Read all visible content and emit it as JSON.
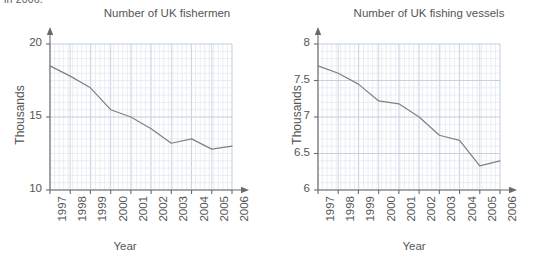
{
  "page": {
    "cut_top_text": "in 2006."
  },
  "charts": [
    {
      "id": "uk-fishermen",
      "title": "Number of UK fishermen",
      "ylabel": "Thousands",
      "xlabel": "Year"
    },
    {
      "id": "uk-fishing-vessels",
      "title": "Number of UK fishing vessels",
      "ylabel": "Thousands",
      "xlabel": "Year"
    }
  ],
  "chart_data": [
    {
      "type": "line",
      "title": "Number of UK fishermen",
      "xlabel": "Year",
      "ylabel": "Thousands",
      "categories": [
        "1997",
        "1998",
        "1999",
        "2000",
        "2001",
        "2002",
        "2003",
        "2004",
        "2005",
        "2006"
      ],
      "x": [
        1997,
        1998,
        1999,
        2000,
        2001,
        2002,
        2003,
        2004,
        2005,
        2006
      ],
      "values": [
        18.5,
        17.8,
        17.0,
        15.5,
        15.0,
        14.2,
        13.2,
        13.5,
        12.8,
        13.0
      ],
      "ylim": [
        10,
        20
      ],
      "yticks": [
        10,
        15,
        20
      ],
      "ytick_labels": [
        "10",
        "15",
        "20"
      ],
      "y_minor_step": 0.5,
      "xlim": [
        1997,
        2006
      ],
      "grid": true,
      "legend": "none",
      "line_color": "#808080"
    },
    {
      "type": "line",
      "title": "Number of UK fishing vessels",
      "xlabel": "Year",
      "ylabel": "Thousands",
      "categories": [
        "1997",
        "1998",
        "1999",
        "2000",
        "2001",
        "2002",
        "2003",
        "2004",
        "2005",
        "2006"
      ],
      "x": [
        1997,
        1998,
        1999,
        2000,
        2001,
        2002,
        2003,
        2004,
        2005,
        2006
      ],
      "values": [
        7.7,
        7.6,
        7.45,
        7.22,
        7.18,
        7.0,
        6.75,
        6.68,
        6.33,
        6.4
      ],
      "ylim": [
        6,
        8
      ],
      "yticks": [
        6,
        6.5,
        7,
        7.5,
        8
      ],
      "ytick_labels": [
        "6",
        "6.5",
        "7",
        "7.5",
        "8"
      ],
      "y_minor_step": 0.1,
      "xlim": [
        1997,
        2006
      ],
      "grid": true,
      "legend": "none",
      "line_color": "#808080"
    }
  ],
  "colors": {
    "grid_minor": "#d8e2ef",
    "grid_major": "#b9c7da",
    "axis": "#6b6b6b",
    "line": "#808080",
    "text": "#555555"
  }
}
